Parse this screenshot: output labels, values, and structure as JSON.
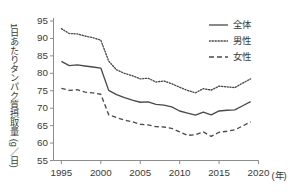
{
  "chart_data": {
    "type": "line",
    "title": "",
    "xlabel": "",
    "ylabel": "1日あたりタンパク質摂取量 (g／日)",
    "x_unit": "(年)",
    "xlim": [
      1994,
      2020
    ],
    "ylim": [
      55,
      95
    ],
    "x_ticks": [
      1995,
      2000,
      2005,
      2010,
      2015,
      2020
    ],
    "y_ticks": [
      55,
      60,
      65,
      70,
      75,
      80,
      85,
      90,
      95
    ],
    "grid": false,
    "legend_position": "top-right",
    "x": [
      1995,
      1996,
      1997,
      1998,
      1999,
      2000,
      2001,
      2002,
      2003,
      2004,
      2005,
      2006,
      2007,
      2008,
      2009,
      2010,
      2011,
      2012,
      2013,
      2014,
      2015,
      2016,
      2017,
      2018,
      2019
    ],
    "series": [
      {
        "name": "全体",
        "style": "solid",
        "color": "#4a4a4a",
        "values": [
          83.4,
          82.2,
          82.4,
          82.1,
          81.8,
          81.5,
          75.1,
          73.9,
          73.0,
          72.3,
          71.7,
          71.8,
          71.1,
          70.9,
          70.4,
          69.2,
          68.6,
          68.0,
          68.9,
          68.1,
          69.2,
          69.4,
          69.5,
          70.7,
          71.9
        ]
      },
      {
        "name": "男性",
        "style": "dotted",
        "color": "#4a4a4a",
        "values": [
          92.8,
          91.4,
          91.3,
          90.7,
          90.2,
          89.5,
          83.5,
          81.0,
          80.0,
          79.3,
          78.4,
          78.6,
          77.5,
          77.8,
          77.0,
          76.0,
          75.1,
          74.4,
          75.6,
          75.2,
          76.3,
          76.1,
          75.9,
          77.2,
          78.4
        ]
      },
      {
        "name": "女性",
        "style": "dashed",
        "color": "#4a4a4a",
        "values": [
          75.7,
          75.1,
          75.3,
          74.6,
          74.4,
          74.0,
          68.1,
          67.3,
          66.6,
          66.1,
          65.4,
          65.2,
          64.7,
          64.6,
          64.2,
          63.2,
          62.2,
          62.4,
          63.2,
          61.9,
          63.1,
          63.4,
          63.8,
          64.9,
          66.1
        ]
      }
    ]
  },
  "axis": {
    "y_tick_labels": [
      "95",
      "90",
      "85",
      "80",
      "75",
      "70",
      "65",
      "60",
      "55"
    ],
    "x_tick_labels": [
      "1995",
      "2000",
      "2005",
      "2010",
      "2015",
      "2020"
    ],
    "x_unit": "(年)",
    "y_title": "1日あたりタンパク質摂取量 (g／日)"
  },
  "legend": {
    "items": [
      {
        "label": "全体",
        "style": "solid"
      },
      {
        "label": "男性",
        "style": "dotted"
      },
      {
        "label": "女性",
        "style": "dashed"
      }
    ]
  },
  "colors": {
    "line": "#4a4a4a",
    "axis": "#8c8c8c",
    "text": "#3a3a3a",
    "background": "#ffffff"
  }
}
